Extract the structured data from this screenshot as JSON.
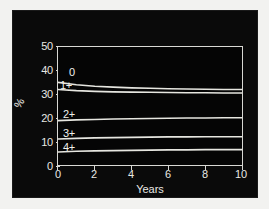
{
  "chart_data": {
    "type": "line",
    "title": "",
    "xlabel": "Years",
    "ylabel": "%",
    "xlim": [
      0,
      10
    ],
    "ylim": [
      0,
      50
    ],
    "xticks": [
      "0",
      "2",
      "4",
      "6",
      "8",
      "10"
    ],
    "yticks": [
      "0",
      "10",
      "20",
      "30",
      "40",
      "50"
    ],
    "grid": false,
    "legend_position": "inline-labels",
    "line_color": "#e6e6e0",
    "background_color": "#050505",
    "x": [
      0,
      1,
      2,
      3,
      4,
      5,
      6,
      7,
      8,
      9,
      10
    ],
    "series": [
      {
        "name": "0",
        "label": "0",
        "values": [
          35.0,
          34.0,
          33.4,
          33.0,
          32.7,
          32.5,
          32.3,
          32.2,
          32.1,
          32.0,
          32.0
        ]
      },
      {
        "name": "1+",
        "label": "1+",
        "values": [
          32.0,
          31.5,
          31.2,
          31.0,
          30.9,
          30.8,
          30.7,
          30.6,
          30.6,
          30.5,
          30.5
        ]
      },
      {
        "name": "2+",
        "label": "2+",
        "values": [
          18.8,
          19.1,
          19.3,
          19.5,
          19.6,
          19.7,
          19.8,
          19.9,
          19.9,
          20.0,
          20.0
        ]
      },
      {
        "name": "3+",
        "label": "3+",
        "values": [
          11.0,
          11.3,
          11.5,
          11.6,
          11.7,
          11.8,
          11.9,
          11.9,
          12.0,
          12.0,
          12.0
        ]
      },
      {
        "name": "4+",
        "label": "4+",
        "values": [
          5.5,
          5.8,
          6.0,
          6.1,
          6.2,
          6.3,
          6.4,
          6.4,
          6.5,
          6.5,
          6.5
        ]
      }
    ]
  }
}
